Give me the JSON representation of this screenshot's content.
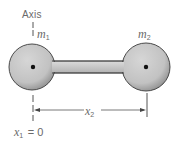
{
  "figure": {
    "axis_label": "Axis",
    "mass1": {
      "symbol": "m",
      "subscript": "1"
    },
    "mass2": {
      "symbol": "m",
      "subscript": "2"
    },
    "distance": {
      "symbol": "x",
      "subscript": "2"
    },
    "origin": {
      "symbol": "x",
      "subscript": "1",
      "equation": "= 0"
    }
  },
  "colors": {
    "sphere_fill": "#c8c8c8",
    "sphere_stroke": "#3a3a3a",
    "rod_fill": "#cfcfcf",
    "line": "#555555",
    "text": "#6a6a6a"
  }
}
